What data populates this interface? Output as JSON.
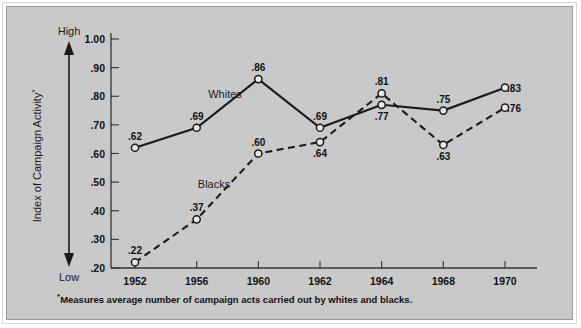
{
  "axes": {
    "y_label": "Index of Campaign Activity",
    "y_label_sup": "*",
    "high_label": "High",
    "low_label": "Low",
    "y_ticks": [
      "1.00",
      ".90",
      ".80",
      ".70",
      ".60",
      ".50",
      ".40",
      ".30",
      ".20"
    ],
    "x_ticks": [
      "1952",
      "1956",
      "1960",
      "1962",
      "1964",
      "1968",
      "1970"
    ]
  },
  "series_labels": {
    "whites": "Whites",
    "blacks": "Blacks"
  },
  "footnote": {
    "marker": "*",
    "text": "Measures average number of campaign acts carried out by whites and blacks."
  },
  "colors": {
    "background": "#c9c9c9",
    "line": "#1a1a1a",
    "marker_fill": "#e8e8e8",
    "page": "#ffffff"
  },
  "chart_data": {
    "type": "line",
    "title": "",
    "xlabel": "",
    "ylabel": "Index of Campaign Activity*",
    "categories": [
      "1952",
      "1956",
      "1960",
      "1962",
      "1964",
      "1968",
      "1970"
    ],
    "x": [
      1952,
      1956,
      1960,
      1962,
      1964,
      1968,
      1970
    ],
    "ylim": [
      0.2,
      1.0
    ],
    "ytick_values": [
      1.0,
      0.9,
      0.8,
      0.7,
      0.6,
      0.5,
      0.4,
      0.3,
      0.2
    ],
    "grid": false,
    "legend_position": "inline-annotation",
    "series": [
      {
        "name": "Whites",
        "style": "solid",
        "marker": "open-circle",
        "values": [
          0.62,
          0.69,
          0.86,
          0.69,
          0.77,
          0.75,
          0.83
        ],
        "labels": [
          ".62",
          ".69",
          ".86",
          ".69",
          ".77",
          ".75",
          ".83"
        ],
        "label_positions": [
          "above",
          "above",
          "above",
          "above",
          "below",
          "above",
          "right"
        ]
      },
      {
        "name": "Blacks",
        "style": "dashed",
        "marker": "open-circle",
        "values": [
          0.22,
          0.37,
          0.6,
          0.64,
          0.81,
          0.63,
          0.76
        ],
        "labels": [
          ".22",
          ".37",
          ".60",
          ".64",
          ".81",
          ".63",
          ".76"
        ],
        "label_positions": [
          "above",
          "above",
          "above",
          "below",
          "above",
          "below",
          "right"
        ]
      }
    ],
    "annotations": [
      {
        "text": "Whites",
        "series": "Whites"
      },
      {
        "text": "Blacks",
        "series": "Blacks"
      },
      {
        "text": "High",
        "axis": "y-top"
      },
      {
        "text": "Low",
        "axis": "y-bottom"
      }
    ]
  }
}
